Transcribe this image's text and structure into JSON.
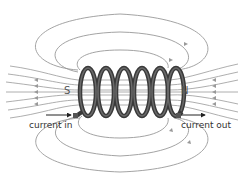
{
  "diagram": {
    "poles": {
      "south": "S",
      "north": "N"
    },
    "labels": {
      "current_in": "current in",
      "current_out": "current out"
    },
    "coil_turns": 6,
    "colors": {
      "field_line": "#999999",
      "coil": "#3a3a3a",
      "coil_highlight": "#6a6a6a",
      "arrow": "#222222",
      "text": "#333333"
    }
  }
}
